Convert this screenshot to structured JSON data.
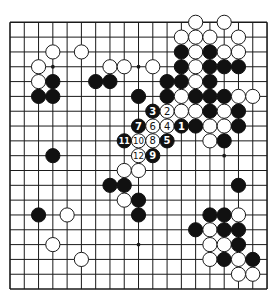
{
  "board": {
    "size": 19,
    "origin_x": 10,
    "origin_y": 22.3,
    "spacing_x": 14.28,
    "spacing_y": 14.82,
    "stone_radius": 7.1,
    "colors": {
      "black": "#111111",
      "white": "#ffffff",
      "line": "#1a1a1a",
      "background": "#ffffff"
    },
    "hoshi": [
      [
        3,
        3
      ],
      [
        9,
        3
      ],
      [
        15,
        9
      ],
      [
        9,
        15
      ]
    ],
    "stones": [
      {
        "c": 13,
        "r": 0,
        "color": "W"
      },
      {
        "c": 15,
        "r": 0,
        "color": "W"
      },
      {
        "c": 12,
        "r": 1,
        "color": "W"
      },
      {
        "c": 13,
        "r": 1,
        "color": "W"
      },
      {
        "c": 14,
        "r": 1,
        "color": "W"
      },
      {
        "c": 16,
        "r": 1,
        "color": "W"
      },
      {
        "c": 3,
        "r": 2,
        "color": "W"
      },
      {
        "c": 5,
        "r": 2,
        "color": "W"
      },
      {
        "c": 12,
        "r": 2,
        "color": "B"
      },
      {
        "c": 13,
        "r": 2,
        "color": "W"
      },
      {
        "c": 14,
        "r": 2,
        "color": "B"
      },
      {
        "c": 15,
        "r": 2,
        "color": "W"
      },
      {
        "c": 16,
        "r": 2,
        "color": "W"
      },
      {
        "c": 2,
        "r": 3,
        "color": "W"
      },
      {
        "c": 7,
        "r": 3,
        "color": "W"
      },
      {
        "c": 8,
        "r": 3,
        "color": "W"
      },
      {
        "c": 10,
        "r": 3,
        "color": "W"
      },
      {
        "c": 12,
        "r": 3,
        "color": "B"
      },
      {
        "c": 13,
        "r": 3,
        "color": "W"
      },
      {
        "c": 14,
        "r": 3,
        "color": "B"
      },
      {
        "c": 15,
        "r": 3,
        "color": "B"
      },
      {
        "c": 16,
        "r": 3,
        "color": "B"
      },
      {
        "c": 2,
        "r": 4,
        "color": "W"
      },
      {
        "c": 3,
        "r": 4,
        "color": "B"
      },
      {
        "c": 6,
        "r": 4,
        "color": "B"
      },
      {
        "c": 7,
        "r": 4,
        "color": "B"
      },
      {
        "c": 11,
        "r": 4,
        "color": "B"
      },
      {
        "c": 12,
        "r": 4,
        "color": "B"
      },
      {
        "c": 13,
        "r": 4,
        "color": "W"
      },
      {
        "c": 14,
        "r": 4,
        "color": "B"
      },
      {
        "c": 2,
        "r": 5,
        "color": "B"
      },
      {
        "c": 3,
        "r": 5,
        "color": "B"
      },
      {
        "c": 9,
        "r": 5,
        "color": "B"
      },
      {
        "c": 11,
        "r": 5,
        "color": "B"
      },
      {
        "c": 12,
        "r": 5,
        "color": "W"
      },
      {
        "c": 13,
        "r": 5,
        "color": "B"
      },
      {
        "c": 14,
        "r": 5,
        "color": "B"
      },
      {
        "c": 15,
        "r": 5,
        "color": "B"
      },
      {
        "c": 16,
        "r": 5,
        "color": "W"
      },
      {
        "c": 17,
        "r": 5,
        "color": "W"
      },
      {
        "c": 10,
        "r": 6,
        "color": "B",
        "label": "3"
      },
      {
        "c": 11,
        "r": 6,
        "color": "W",
        "label": "2"
      },
      {
        "c": 12,
        "r": 6,
        "color": "W"
      },
      {
        "c": 13,
        "r": 6,
        "color": "W"
      },
      {
        "c": 14,
        "r": 6,
        "color": "B"
      },
      {
        "c": 15,
        "r": 6,
        "color": "W"
      },
      {
        "c": 16,
        "r": 6,
        "color": "B"
      },
      {
        "c": 9,
        "r": 7,
        "color": "B",
        "label": "7"
      },
      {
        "c": 10,
        "r": 7,
        "color": "W",
        "label": "6"
      },
      {
        "c": 11,
        "r": 7,
        "color": "W",
        "label": "4"
      },
      {
        "c": 12,
        "r": 7,
        "color": "B",
        "label": "1"
      },
      {
        "c": 13,
        "r": 7,
        "color": "B"
      },
      {
        "c": 14,
        "r": 7,
        "color": "W"
      },
      {
        "c": 15,
        "r": 7,
        "color": "W"
      },
      {
        "c": 16,
        "r": 7,
        "color": "B"
      },
      {
        "c": 8,
        "r": 8,
        "color": "B",
        "label": "11"
      },
      {
        "c": 9,
        "r": 8,
        "color": "W",
        "label": "10"
      },
      {
        "c": 10,
        "r": 8,
        "color": "W",
        "label": "8"
      },
      {
        "c": 11,
        "r": 8,
        "color": "B",
        "label": "5"
      },
      {
        "c": 14,
        "r": 8,
        "color": "W"
      },
      {
        "c": 15,
        "r": 8,
        "color": "B"
      },
      {
        "c": 3,
        "r": 9,
        "color": "B"
      },
      {
        "c": 9,
        "r": 9,
        "color": "W",
        "label": "12"
      },
      {
        "c": 10,
        "r": 9,
        "color": "B",
        "label": "9"
      },
      {
        "c": 8,
        "r": 10,
        "color": "W"
      },
      {
        "c": 9,
        "r": 10,
        "color": "W"
      },
      {
        "c": 7,
        "r": 11,
        "color": "B"
      },
      {
        "c": 8,
        "r": 11,
        "color": "B"
      },
      {
        "c": 16,
        "r": 11,
        "color": "B"
      },
      {
        "c": 8,
        "r": 12,
        "color": "W"
      },
      {
        "c": 9,
        "r": 12,
        "color": "B"
      },
      {
        "c": 2,
        "r": 13,
        "color": "B"
      },
      {
        "c": 4,
        "r": 13,
        "color": "W"
      },
      {
        "c": 9,
        "r": 13,
        "color": "B"
      },
      {
        "c": 14,
        "r": 13,
        "color": "B"
      },
      {
        "c": 15,
        "r": 13,
        "color": "B"
      },
      {
        "c": 16,
        "r": 13,
        "color": "W"
      },
      {
        "c": 13,
        "r": 14,
        "color": "B"
      },
      {
        "c": 14,
        "r": 14,
        "color": "W"
      },
      {
        "c": 15,
        "r": 14,
        "color": "B"
      },
      {
        "c": 16,
        "r": 14,
        "color": "B"
      },
      {
        "c": 3,
        "r": 15,
        "color": "W"
      },
      {
        "c": 14,
        "r": 15,
        "color": "W"
      },
      {
        "c": 15,
        "r": 15,
        "color": "W"
      },
      {
        "c": 16,
        "r": 15,
        "color": "B"
      },
      {
        "c": 5,
        "r": 16,
        "color": "W"
      },
      {
        "c": 14,
        "r": 16,
        "color": "W"
      },
      {
        "c": 15,
        "r": 16,
        "color": "B"
      },
      {
        "c": 16,
        "r": 16,
        "color": "W"
      },
      {
        "c": 17,
        "r": 16,
        "color": "B"
      },
      {
        "c": 16,
        "r": 17,
        "color": "W"
      },
      {
        "c": 17,
        "r": 17,
        "color": "W"
      }
    ]
  }
}
